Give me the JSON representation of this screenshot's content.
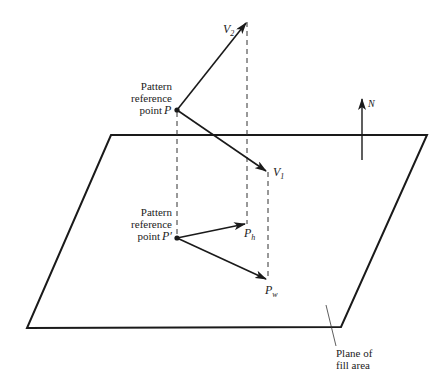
{
  "diagram": {
    "type": "pattern-reference-geometry",
    "colors": {
      "line": "#1a1a1a",
      "background": "#ffffff",
      "text": "#222222"
    },
    "plane": {
      "label_line1": "Plane of",
      "label_line2": "fill area",
      "corners": [
        [
          111,
          135
        ],
        [
          427,
          135
        ],
        [
          341,
          327
        ],
        [
          27,
          328
        ]
      ]
    },
    "point_p": {
      "label_line1": "Pattern",
      "label_line2": "reference",
      "label_line3": "point",
      "symbol": "P",
      "pos": [
        177,
        110
      ]
    },
    "point_p_prime": {
      "label_line1": "Pattern",
      "label_line2": "reference",
      "label_line3": "point",
      "symbol": "P′",
      "pos": [
        177,
        238
      ]
    },
    "vectors": {
      "v1": {
        "symbol": "V",
        "subscript": "1",
        "tip": [
          268,
          172
        ]
      },
      "v2": {
        "symbol": "V",
        "subscript": "2",
        "tip": [
          247,
          22
        ]
      },
      "ph": {
        "symbol": "P",
        "subscript": "h",
        "tip": [
          247,
          224
        ]
      },
      "pw": {
        "symbol": "P",
        "subscript": "w",
        "tip": [
          268,
          280
        ]
      }
    },
    "normal": {
      "symbol": "N"
    }
  }
}
